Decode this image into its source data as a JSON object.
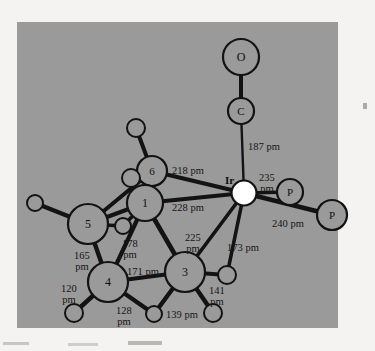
{
  "figure": {
    "title": "",
    "panel": {
      "bg_color": "#9a9a9a",
      "page_bg": "#f4f3f1",
      "x": 17,
      "y": 22,
      "width": 321,
      "height": 306
    },
    "bond_color": "#131313",
    "atom_fill": "#9a9a9a",
    "atom_stroke": "#131313",
    "metal_fill": "#ffffff",
    "unit": "pm"
  },
  "atoms": [
    {
      "id": "O",
      "label": "O",
      "cx": 241,
      "cy": 57,
      "r": 18,
      "kind": "oxygen"
    },
    {
      "id": "C",
      "label": "C",
      "cx": 241,
      "cy": 111,
      "r": 13,
      "kind": "carbon"
    },
    {
      "id": "Ir",
      "label": "Ir",
      "cx": 244,
      "cy": 193,
      "r": 12.5,
      "kind": "metal"
    },
    {
      "id": "P1",
      "label": "P",
      "cx": 290,
      "cy": 192,
      "r": 13,
      "kind": "phosphorus"
    },
    {
      "id": "P2",
      "label": "P",
      "cx": 332,
      "cy": 215,
      "r": 15,
      "kind": "phosphorus"
    },
    {
      "id": "A6",
      "label": "6",
      "cx": 152,
      "cy": 171,
      "r": 15,
      "kind": "carbon-numbered"
    },
    {
      "id": "A1",
      "label": "1",
      "cx": 145,
      "cy": 203,
      "r": 18,
      "kind": "carbon-numbered"
    },
    {
      "id": "A5",
      "label": "5",
      "cx": 88,
      "cy": 224,
      "r": 20,
      "kind": "carbon-numbered"
    },
    {
      "id": "A4",
      "label": "4",
      "cx": 108,
      "cy": 282,
      "r": 20,
      "kind": "carbon-numbered"
    },
    {
      "id": "A3",
      "label": "3",
      "cx": 185,
      "cy": 272,
      "r": 20,
      "kind": "carbon-numbered"
    },
    {
      "id": "H1",
      "label": "",
      "cx": 136,
      "cy": 128,
      "r": 9,
      "kind": "hydrogen"
    },
    {
      "id": "H2",
      "label": "",
      "cx": 131,
      "cy": 178,
      "r": 9,
      "kind": "hydrogen"
    },
    {
      "id": "H3",
      "label": "",
      "cx": 35,
      "cy": 203,
      "r": 8,
      "kind": "hydrogen"
    },
    {
      "id": "H4",
      "label": "",
      "cx": 123,
      "cy": 226,
      "r": 8,
      "kind": "hydrogen"
    },
    {
      "id": "H5",
      "label": "",
      "cx": 74,
      "cy": 313,
      "r": 9,
      "kind": "hydrogen"
    },
    {
      "id": "H6",
      "label": "",
      "cx": 154,
      "cy": 314,
      "r": 8,
      "kind": "hydrogen"
    },
    {
      "id": "H7",
      "label": "",
      "cx": 213,
      "cy": 313,
      "r": 9,
      "kind": "hydrogen"
    },
    {
      "id": "H8",
      "label": "",
      "cx": 227,
      "cy": 275,
      "r": 9,
      "kind": "hydrogen"
    }
  ],
  "bonds": [
    {
      "from": "O",
      "to": "C",
      "width": 4.0
    },
    {
      "from": "C",
      "to": "Ir",
      "width": 2.4
    },
    {
      "from": "Ir",
      "to": "P1",
      "width": 3.6
    },
    {
      "from": "Ir",
      "to": "P2",
      "width": 4.6
    },
    {
      "from": "Ir",
      "to": "A6",
      "width": 4.2
    },
    {
      "from": "Ir",
      "to": "A1",
      "width": 4.2
    },
    {
      "from": "Ir",
      "to": "A3",
      "width": 3.6
    },
    {
      "from": "Ir",
      "to": "H8",
      "width": 3.6
    },
    {
      "from": "A6",
      "to": "A1",
      "width": 5.5
    },
    {
      "from": "A6",
      "to": "H1",
      "width": 4.0
    },
    {
      "from": "A6",
      "to": "H2",
      "width": 4.0
    },
    {
      "from": "A6",
      "to": "A5",
      "width": 4.0
    },
    {
      "from": "A1",
      "to": "A5",
      "width": 4.0
    },
    {
      "from": "A1",
      "to": "A4",
      "width": 4.2
    },
    {
      "from": "A1",
      "to": "A3",
      "width": 4.6
    },
    {
      "from": "A1",
      "to": "H4",
      "width": 3.6
    },
    {
      "from": "A5",
      "to": "H3",
      "width": 4.4
    },
    {
      "from": "A5",
      "to": "H4",
      "width": 3.4
    },
    {
      "from": "A5",
      "to": "A4",
      "width": 4.4
    },
    {
      "from": "A4",
      "to": "A3",
      "width": 4.0
    },
    {
      "from": "A4",
      "to": "H5",
      "width": 4.4
    },
    {
      "from": "A4",
      "to": "H6",
      "width": 4.4
    },
    {
      "from": "A3",
      "to": "H6",
      "width": 4.4
    },
    {
      "from": "A3",
      "to": "H7",
      "width": 4.4
    },
    {
      "from": "A3",
      "to": "H8",
      "width": 4.0
    }
  ],
  "labels": [
    {
      "id": "l187",
      "text": "187 pm",
      "x": 248,
      "y": 142,
      "lines": 1
    },
    {
      "id": "l218",
      "text": "218 pm",
      "x": 172,
      "y": 166,
      "lines": 1
    },
    {
      "id": "l228",
      "text": "228 pm",
      "x": 172,
      "y": 203,
      "lines": 1
    },
    {
      "id": "l235",
      "text": "235\npm",
      "x": 259,
      "y": 172,
      "lines": 2
    },
    {
      "id": "l240",
      "text": "240 pm",
      "x": 272,
      "y": 219,
      "lines": 1
    },
    {
      "id": "l225",
      "text": "225\npm",
      "x": 185,
      "y": 232,
      "lines": 2
    },
    {
      "id": "l173",
      "text": "173 pm",
      "x": 227,
      "y": 243,
      "lines": 1
    },
    {
      "id": "l178",
      "text": "178\npm",
      "x": 122,
      "y": 238,
      "lines": 2
    },
    {
      "id": "l165",
      "text": "165\npm",
      "x": 74,
      "y": 250,
      "lines": 2
    },
    {
      "id": "l171",
      "text": "171 pm",
      "x": 127,
      "y": 267,
      "lines": 1
    },
    {
      "id": "l141",
      "text": "141\npm",
      "x": 209,
      "y": 285,
      "lines": 2
    },
    {
      "id": "l120",
      "text": "120\npm",
      "x": 61,
      "y": 283,
      "lines": 2
    },
    {
      "id": "l128",
      "text": "128\npm",
      "x": 116,
      "y": 305,
      "lines": 2
    },
    {
      "id": "l139",
      "text": "139 pm",
      "x": 166,
      "y": 310,
      "lines": 1
    },
    {
      "id": "lIr",
      "text": "Ir",
      "x": 225,
      "y": 174,
      "lines": 1
    }
  ]
}
